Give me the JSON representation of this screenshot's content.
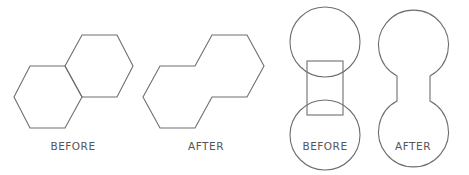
{
  "diagram": {
    "panels": [
      {
        "id": "hex-before",
        "label": "BEFORE",
        "description": "Two overlapping adjacent hexagons sharing an edge"
      },
      {
        "id": "hex-after",
        "label": "AFTER",
        "description": "Merged outline of two hexagons (union)"
      },
      {
        "id": "circle-before",
        "label": "BEFORE",
        "description": "Two circles connected by a vertical rectangle"
      },
      {
        "id": "circle-after",
        "label": "AFTER",
        "description": "Merged dumbbell outline (union of circles and rectangle)"
      }
    ],
    "stroke_color": "#6e6e6e",
    "background": "#ffffff"
  }
}
